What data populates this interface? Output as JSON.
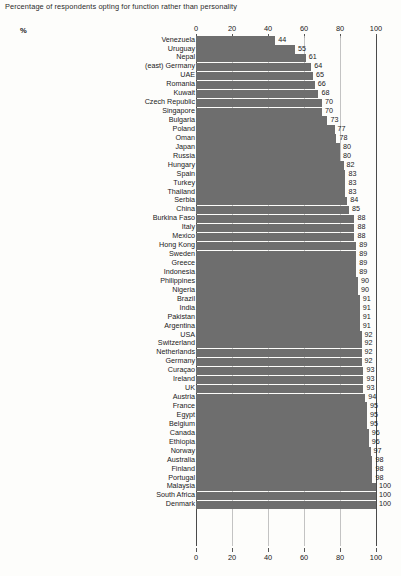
{
  "chart_data": {
    "type": "bar",
    "orientation": "horizontal",
    "title": "Percentage of respondents opting for function rather than personality",
    "unit_label": "%",
    "xlabel": "",
    "ylabel": "",
    "xlim": [
      0,
      100
    ],
    "xticks": [
      0,
      20,
      40,
      60,
      80,
      100
    ],
    "xtick_labels": [
      "0",
      "20",
      "40",
      "60",
      "80",
      "100"
    ],
    "grid": true,
    "grid_axis": "x",
    "legend": null,
    "axis_positions": [
      "top",
      "bottom"
    ],
    "bar_color": "#6e6e6e",
    "categories": [
      "Venezuela",
      "Uruguay",
      "Nepal",
      "(east) Germany",
      "UAE",
      "Romania",
      "Kuwait",
      "Czech Republic",
      "Singapore",
      "Bulgaria",
      "Poland",
      "Oman",
      "Japan",
      "Russia",
      "Hungary",
      "Spain",
      "Turkey",
      "Thailand",
      "Serbia",
      "China",
      "Burkina Faso",
      "Italy",
      "Mexico",
      "Hong Kong",
      "Sweden",
      "Greece",
      "Indonesia",
      "Philippines",
      "Nigeria",
      "Brazil",
      "India",
      "Pakistan",
      "Argentina",
      "USA",
      "Switzerland",
      "Netherlands",
      "Germany",
      "Curaçao",
      "Ireland",
      "UK",
      "Austria",
      "France",
      "Egypt",
      "Belgium",
      "Canada",
      "Ethiopia",
      "Norway",
      "Australia",
      "Finland",
      "Portugal",
      "Malaysia",
      "South Africa",
      "Denmark"
    ],
    "values": [
      44,
      55,
      61,
      64,
      65,
      66,
      68,
      70,
      70,
      73,
      77,
      78,
      80,
      80,
      82,
      83,
      83,
      83,
      84,
      85,
      88,
      88,
      88,
      89,
      89,
      89,
      89,
      90,
      90,
      91,
      91,
      91,
      91,
      92,
      92,
      92,
      92,
      93,
      93,
      93,
      94,
      95,
      95,
      95,
      96,
      96,
      97,
      98,
      98,
      98,
      100,
      100,
      100
    ]
  }
}
